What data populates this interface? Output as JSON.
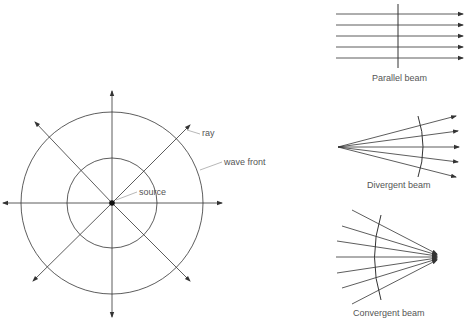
{
  "point_source": {
    "labels": {
      "ray": "ray",
      "wave_front": "wave front",
      "source": "source"
    }
  },
  "parallel_beam": {
    "caption": "Parallel beam"
  },
  "divergent_beam": {
    "caption": "Divergent beam"
  },
  "convergent_beam": {
    "caption": "Convergent beam"
  },
  "colors": {
    "line": "#333333",
    "text": "#555555"
  }
}
